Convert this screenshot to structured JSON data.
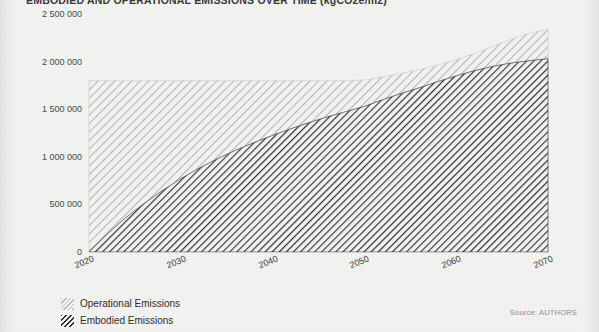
{
  "page": {
    "background_color": "#f2f2f0",
    "gutter_color": "#e4e4e2"
  },
  "source_note": "Source: AUTHORS",
  "legend": {
    "items": [
      {
        "label": "Operational Emissions",
        "swatch": "operational",
        "color": "#b9b9b7"
      },
      {
        "label": "Embodied Emissions",
        "swatch": "embodied",
        "color": "#2d2d2d"
      }
    ]
  },
  "chart_data": {
    "type": "area",
    "stacked": true,
    "title": "EMBODIED AND OPERATIONAL EMISSIONS OVER TIME (kgCO2e/m2)",
    "xlabel": "",
    "ylabel": "",
    "xlim": [
      2020,
      2070
    ],
    "ylim": [
      0,
      2500000
    ],
    "grid": false,
    "legend_position": "bottom-left",
    "xticks": [
      2020,
      2030,
      2040,
      2050,
      2060,
      2070
    ],
    "xtick_labels": [
      "2020",
      "2030",
      "2040",
      "2050",
      "2060",
      "2070"
    ],
    "yticks": [
      0,
      500000,
      1000000,
      1500000,
      2000000,
      2500000
    ],
    "ytick_labels": [
      "0",
      "500 000",
      "1 000 000",
      "1 500 000",
      "2 000 000",
      "2 500 000"
    ],
    "x": [
      2020,
      2022,
      2024,
      2026,
      2028,
      2030,
      2032,
      2034,
      2036,
      2038,
      2040,
      2042,
      2044,
      2046,
      2048,
      2050,
      2052,
      2054,
      2056,
      2058,
      2060,
      2062,
      2064,
      2066,
      2068,
      2070
    ],
    "series": [
      {
        "name": "Embodied Emissions",
        "color": "#2d2d2d",
        "hatch": "///",
        "values": [
          0,
          190000,
          360000,
          510000,
          645000,
          770000,
          880000,
          980000,
          1070000,
          1150000,
          1225000,
          1295000,
          1360000,
          1420000,
          1475000,
          1530000,
          1600000,
          1665000,
          1725000,
          1790000,
          1850000,
          1905000,
          1950000,
          1985000,
          2010000,
          2030000
        ]
      },
      {
        "name": "Operational Emissions",
        "color": "#b9b9b7",
        "hatch": "///",
        "values": [
          1800000,
          1610000,
          1440000,
          1290000,
          1155000,
          1030000,
          920000,
          820000,
          730000,
          650000,
          575000,
          505000,
          440000,
          380000,
          325000,
          275000,
          240000,
          210000,
          190000,
          175000,
          170000,
          180000,
          210000,
          250000,
          290000,
          310000
        ]
      }
    ],
    "total_values": [
      1800000,
      1800000,
      1800000,
      1800000,
      1800000,
      1800000,
      1800000,
      1800000,
      1800000,
      1800000,
      1800000,
      1800000,
      1800000,
      1800000,
      1800000,
      1805000,
      1840000,
      1875000,
      1915000,
      1965000,
      2020000,
      2085000,
      2160000,
      2235000,
      2300000,
      2340000
    ]
  }
}
